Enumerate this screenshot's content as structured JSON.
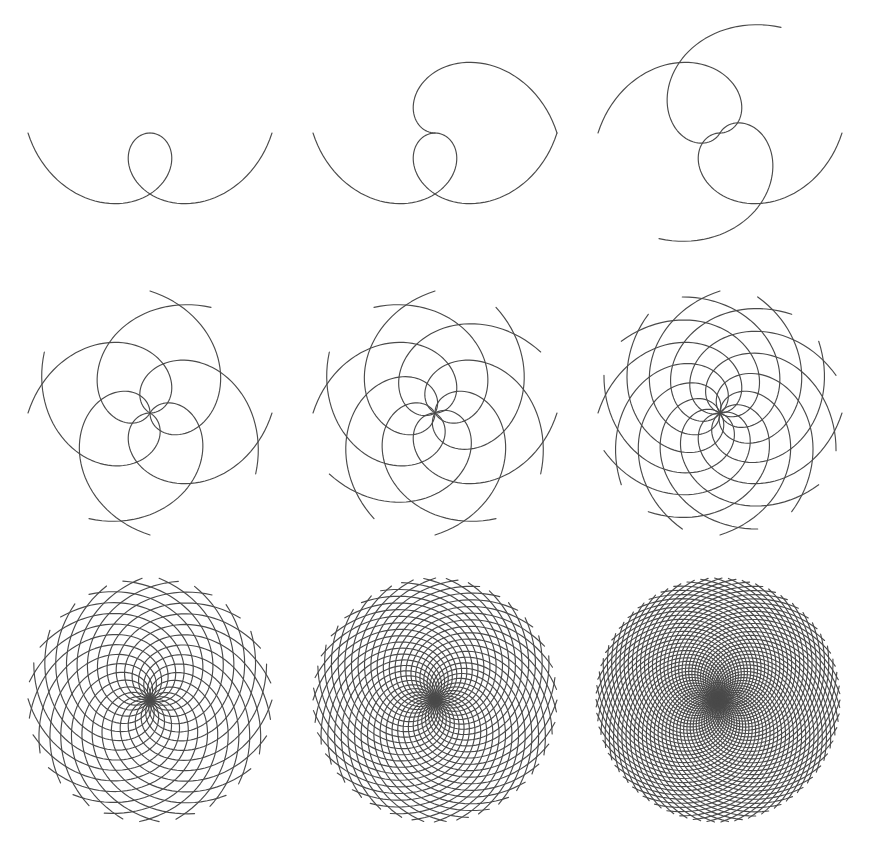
{
  "figure": {
    "width": 870,
    "height": 863,
    "background": "#ffffff",
    "stroke_color": "#4a4a4a",
    "stroke_width": 1.15
  },
  "chart_data": {
    "type": "diagram",
    "grid": {
      "rows": 3,
      "cols": 3
    },
    "sweep_degrees": 180,
    "panels": [
      {
        "id": 1,
        "cx": 150,
        "cy": 133,
        "R": 122,
        "cw": {
          "count": 1,
          "offset_deg": 0
        },
        "ccw": {
          "count": 1,
          "offset_deg": 180
        }
      },
      {
        "id": 2,
        "cx": 435,
        "cy": 133,
        "R": 122,
        "cw": {
          "count": 1,
          "offset_deg": 0
        },
        "ccw": {
          "count": 2,
          "offset_deg": 0
        }
      },
      {
        "id": 3,
        "cx": 720,
        "cy": 133,
        "R": 122,
        "cw": {
          "count": 2,
          "offset_deg": 0
        },
        "ccw": {
          "count": 2,
          "offset_deg": 60
        }
      },
      {
        "id": 4,
        "cx": 150,
        "cy": 413,
        "R": 122,
        "cw": {
          "count": 4,
          "offset_deg": 0
        },
        "ccw": {
          "count": 4,
          "offset_deg": 60
        }
      },
      {
        "id": 5,
        "cx": 435,
        "cy": 413,
        "R": 122,
        "cw": {
          "count": 6,
          "offset_deg": 0
        },
        "ccw": {
          "count": 6,
          "offset_deg": 30
        }
      },
      {
        "id": 6,
        "cx": 720,
        "cy": 413,
        "R": 122,
        "cw": {
          "count": 10,
          "offset_deg": 0
        },
        "ccw": {
          "count": 10,
          "offset_deg": 18
        }
      },
      {
        "id": 7,
        "cx": 150,
        "cy": 700,
        "R": 122,
        "cw": {
          "count": 21,
          "offset_deg": 0
        },
        "ccw": {
          "count": 21,
          "offset_deg": 8
        }
      },
      {
        "id": 8,
        "cx": 435,
        "cy": 700,
        "R": 122,
        "cw": {
          "count": 34,
          "offset_deg": 0
        },
        "ccw": {
          "count": 34,
          "offset_deg": 5
        }
      },
      {
        "id": 9,
        "cx": 718,
        "cy": 700,
        "R": 122,
        "cw": {
          "count": 55,
          "offset_deg": 0
        },
        "ccw": {
          "count": 55,
          "offset_deg": 3
        }
      }
    ]
  }
}
